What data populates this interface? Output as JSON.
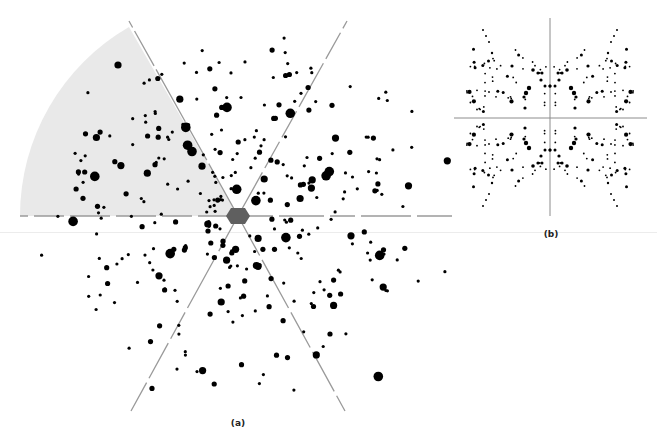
{
  "figure": {
    "panels": [
      {
        "id": "a",
        "label": "(a)",
        "description": "Spot pattern with six-fold radial lines and a shaded angular sector"
      },
      {
        "id": "b",
        "label": "(b)",
        "description": "Symmetric spot pattern with horizontal and vertical axes"
      }
    ]
  },
  "colors": {
    "background": "#ffffff",
    "sector_fill": "#e9e9e9",
    "line": "#9a9a9a",
    "spot": "#000000",
    "center_hexagon": "#5f5f5f"
  }
}
